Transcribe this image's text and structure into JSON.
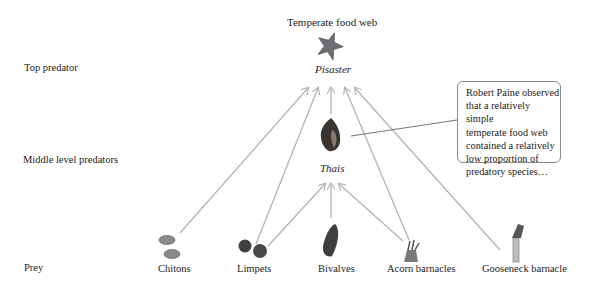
{
  "title": "Temperate food web",
  "levels": {
    "top": "Top predator",
    "middle": "Middle level predators",
    "prey": "Prey"
  },
  "nodes": {
    "top_predator": {
      "label": "Pisaster",
      "icon": "starfish-icon"
    },
    "middle_predator": {
      "label": "Thais",
      "icon": "snail-shell-icon"
    },
    "prey": [
      {
        "label": "Chitons",
        "icon": "chiton-icon"
      },
      {
        "label": "Limpets",
        "icon": "limpet-icon"
      },
      {
        "label": "Bivalves",
        "icon": "mussel-icon"
      },
      {
        "label": "Acorn barnacles",
        "icon": "acorn-barnacle-icon"
      },
      {
        "label": "Gooseneck barnacle",
        "icon": "gooseneck-barnacle-icon"
      }
    ]
  },
  "edges": [
    {
      "from": "Chitons",
      "to": "Pisaster"
    },
    {
      "from": "Limpets",
      "to": "Pisaster"
    },
    {
      "from": "Limpets",
      "to": "Thais"
    },
    {
      "from": "Bivalves",
      "to": "Thais"
    },
    {
      "from": "Thais",
      "to": "Pisaster"
    },
    {
      "from": "Acorn barnacles",
      "to": "Thais"
    },
    {
      "from": "Acorn barnacles",
      "to": "Pisaster"
    },
    {
      "from": "Gooseneck barnacle",
      "to": "Pisaster"
    }
  ],
  "callout": {
    "text": "Robert Paine observed that a relatively simple temperate food web contained a relatively low proportion of predatory species…",
    "lines": [
      "Robert Paine observed",
      "that a relatively simple",
      "temperate food web",
      "contained a relatively",
      "low proportion of",
      "predatory species…"
    ]
  },
  "colors": {
    "arrow": "#b4b4b4",
    "callout_border": "#8a8a8a",
    "text": "#222222"
  }
}
